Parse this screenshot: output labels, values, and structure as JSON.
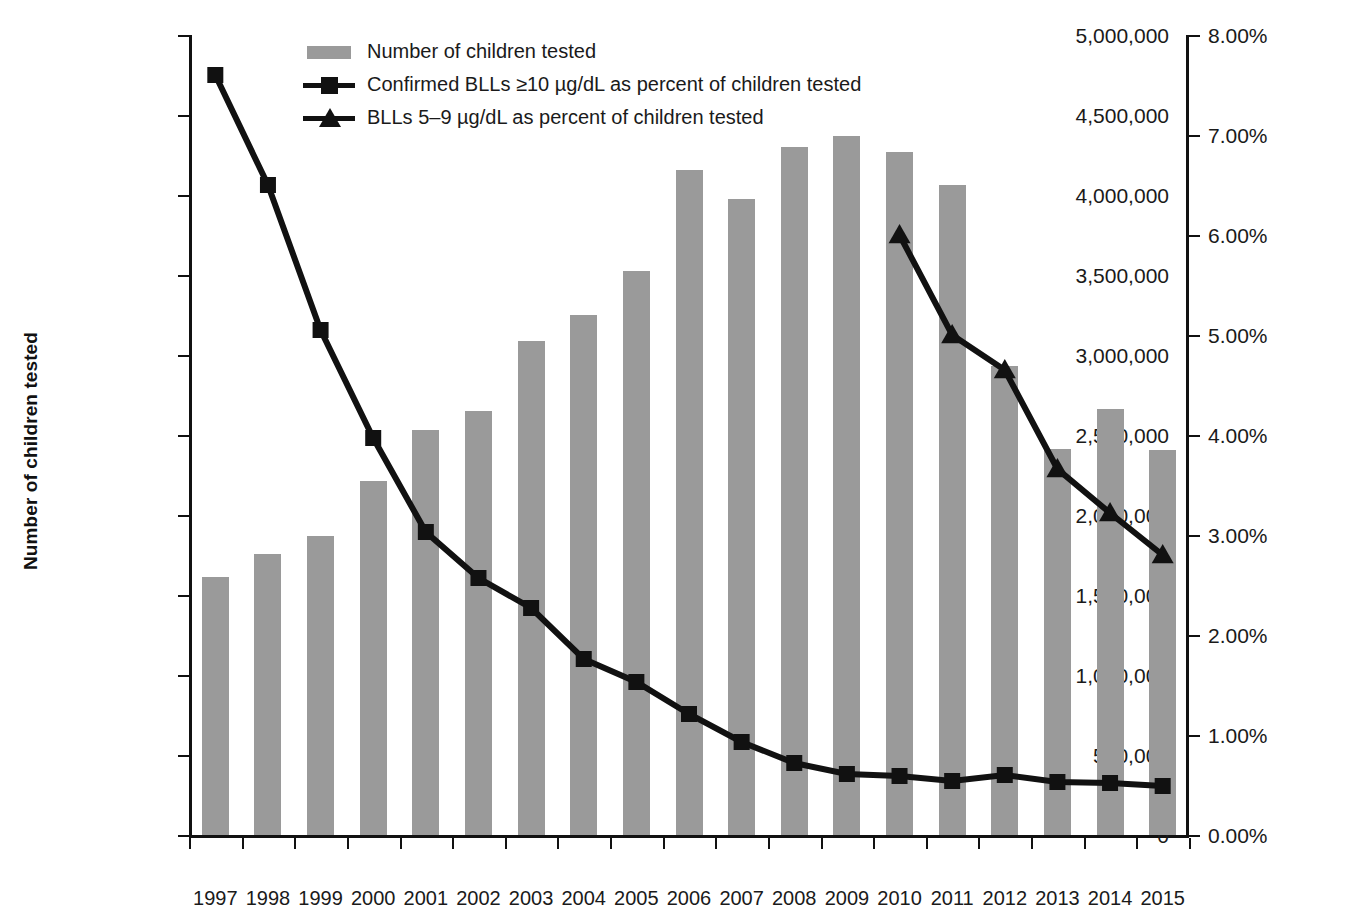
{
  "chart_data": {
    "type": "bar",
    "title": "",
    "subtitle": "",
    "xlabel": "",
    "ylabel": "Number of children tested",
    "y2label": "Blood lead levels as % children tested",
    "grid": false,
    "legend_position": "top-center",
    "categories": [
      "1997",
      "1998",
      "1999",
      "2000",
      "2001",
      "2002",
      "2003",
      "2004",
      "2005",
      "2006",
      "2007",
      "2008",
      "2009",
      "2010",
      "2011",
      "2012",
      "2013",
      "2014",
      "2015"
    ],
    "ylim": [
      0,
      5000000
    ],
    "y2lim": [
      0,
      8
    ],
    "ytick_labels": [
      "0",
      "500,000",
      "1,000,000",
      "1,500,000",
      "2,000,000",
      "2,500,000",
      "3,000,000",
      "3,500,000",
      "4,000,000",
      "4,500,000",
      "5,000,000"
    ],
    "ytick_values": [
      0,
      500000,
      1000000,
      1500000,
      2000000,
      2500000,
      3000000,
      3500000,
      4000000,
      4500000,
      5000000
    ],
    "y2tick_labels": [
      "0.00%",
      "1.00%",
      "2.00%",
      "3.00%",
      "4.00%",
      "5.00%",
      "6.00%",
      "7.00%",
      "8.00%"
    ],
    "y2tick_values": [
      0,
      1,
      2,
      3,
      4,
      5,
      6,
      7,
      8
    ],
    "series": [
      {
        "name": "Number of children tested",
        "kind": "bar",
        "axis": "left",
        "color": "#9a9a9a",
        "values": [
          1610000,
          1755000,
          1870000,
          2215000,
          2530000,
          2650000,
          3090000,
          3250000,
          3525000,
          4155000,
          3975000,
          4300000,
          4370000,
          4270000,
          4060000,
          2930000,
          2410000,
          2665000,
          2405000
        ]
      },
      {
        "name": "Confirmed BLLs ≥10 µg/dL as percent of children tested",
        "kind": "line",
        "marker": "square",
        "axis": "right",
        "color": "#111111",
        "values": [
          7.6,
          6.5,
          5.05,
          3.97,
          3.03,
          2.57,
          2.27,
          1.76,
          1.53,
          1.21,
          0.93,
          0.72,
          0.61,
          0.59,
          0.54,
          0.6,
          0.53,
          0.52,
          0.49
        ]
      },
      {
        "name": "BLLs 5–9 µg/dL as percent of children tested",
        "kind": "line",
        "marker": "triangle",
        "axis": "right",
        "color": "#111111",
        "values": [
          null,
          null,
          null,
          null,
          null,
          null,
          null,
          null,
          null,
          null,
          null,
          null,
          null,
          6.0,
          5.0,
          4.65,
          3.66,
          3.22,
          2.8
        ]
      }
    ]
  },
  "legend": {
    "items": [
      {
        "label": "Number of children tested",
        "key": "swatch"
      },
      {
        "label": "Confirmed BLLs ≥10 µg/dL as percent of children tested",
        "key": "line-square"
      },
      {
        "label": "BLLs 5–9 µg/dL as percent of children tested",
        "key": "line-triangle"
      }
    ]
  }
}
